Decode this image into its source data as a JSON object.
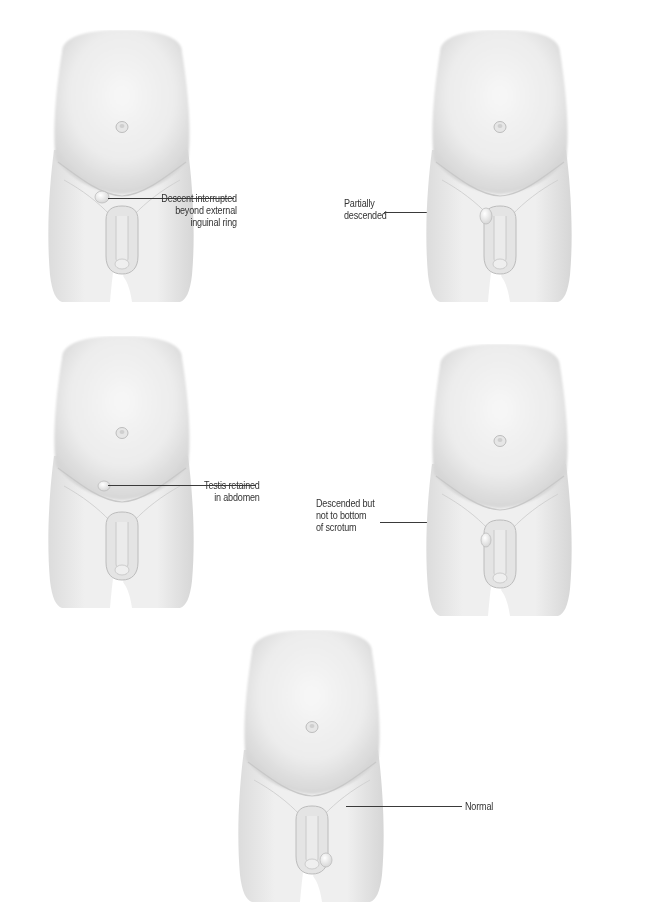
{
  "figure_title": "Undescended testis positions",
  "panels": [
    {
      "id": "descent-interrupted",
      "label_lines": [
        "Descent interrupted",
        "beyond external",
        "inguinal ring"
      ],
      "position": "top-left"
    },
    {
      "id": "partially-descended",
      "label_lines": [
        "Partially",
        "descended"
      ],
      "position": "top-right"
    },
    {
      "id": "retained-in-abdomen",
      "label_lines": [
        "Testis retained",
        "in abdomen"
      ],
      "position": "middle-left"
    },
    {
      "id": "not-to-bottom",
      "label_lines": [
        "Descended but",
        "not to bottom",
        "of scrotum"
      ],
      "position": "middle-right"
    },
    {
      "id": "normal",
      "label_lines": [
        "Normal"
      ],
      "position": "bottom-center"
    }
  ],
  "colors": {
    "background": "#ffffff",
    "skin_light": "#f4f4f4",
    "skin_mid": "#e2e2e2",
    "skin_shadow": "#c9c9c9",
    "leader_line": "#3a3a3a",
    "label_text": "#333333"
  }
}
